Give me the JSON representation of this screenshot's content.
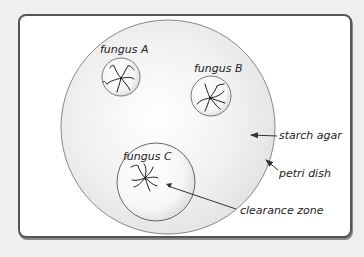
{
  "diagram": {
    "title": "",
    "labels": {
      "fungus_a": "fungus A",
      "fungus_b": "fungus B",
      "fungus_c": "fungus C",
      "starch_agar": "starch agar",
      "petri_dish": "petri dish",
      "clearance_zone": "clearance zone"
    },
    "colors": {
      "background": "#efefef",
      "frame_border": "#555555",
      "frame_fill": "#ffffff",
      "dish_outline": "#888888",
      "agar_fill": "#e8e8e8",
      "colony_outline": "#777777",
      "hyphae": "#1a1a1a",
      "text": "#222222"
    }
  }
}
